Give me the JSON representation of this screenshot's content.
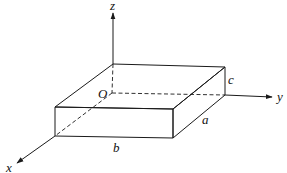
{
  "diagram": {
    "axes": {
      "x": {
        "label": "x"
      },
      "y": {
        "label": "y"
      },
      "z": {
        "label": "z"
      }
    },
    "origin": {
      "label": "O"
    },
    "dimensions": {
      "a": {
        "label": "a",
        "edge": "depth along x"
      },
      "b": {
        "label": "b",
        "edge": "width along y"
      },
      "c": {
        "label": "c",
        "edge": "height along z"
      }
    }
  }
}
